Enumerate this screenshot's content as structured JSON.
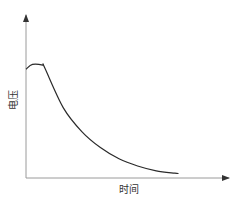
{
  "chart_data": {
    "type": "line",
    "title": "",
    "xlabel": "时间",
    "ylabel": "电压",
    "xlim": [
      0,
      10
    ],
    "ylim": [
      0,
      10
    ],
    "grid": false,
    "legend": "none",
    "axis_ticks": "none",
    "series": [
      {
        "name": "电压",
        "x": [
          0,
          0.35,
          0.9,
          1.0,
          2,
          3,
          4,
          5,
          6,
          7,
          8,
          8.2
        ],
        "y": [
          6.8,
          7.1,
          7.05,
          6.9,
          4.4,
          2.9,
          1.9,
          1.2,
          0.75,
          0.45,
          0.3,
          0.28
        ]
      }
    ]
  }
}
